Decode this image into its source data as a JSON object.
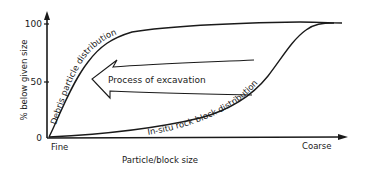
{
  "diagram": {
    "type": "hand-drawn cumulative size distribution sketch",
    "y_axis": {
      "label": "% below given size",
      "ticks": [
        "100",
        "50",
        "0"
      ]
    },
    "x_axis": {
      "label": "Particle/block size",
      "start_label": "Fine",
      "end_label": "Coarse"
    },
    "curves": [
      {
        "name": "debris",
        "label": "Debris particle distribution"
      },
      {
        "name": "in-situ",
        "label": "In-situ rock block distribution"
      }
    ],
    "arrow": {
      "label": "Process of excavation",
      "direction": "left"
    },
    "colors": {
      "ink": "#1a1a1a",
      "background": "#ffffff"
    }
  }
}
